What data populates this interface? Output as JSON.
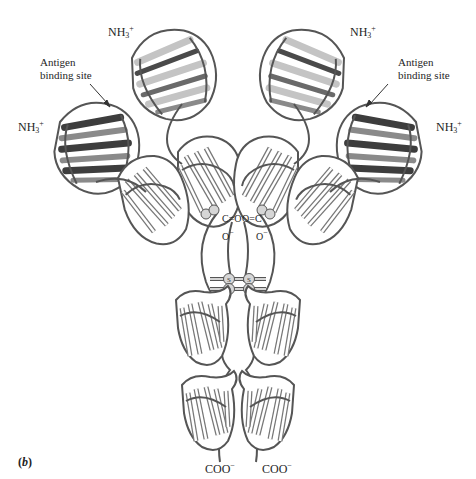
{
  "figure": {
    "panel_label": "b",
    "colors": {
      "heavy_dark": "#4a4a4a",
      "medium_gray": "#8a8a8a",
      "light_gray": "#c4c4c4",
      "outline": "#555555",
      "background": "#ffffff"
    }
  },
  "labels": {
    "nh3_top_left": {
      "base": "NH",
      "sub": "3",
      "sup": "+"
    },
    "nh3_left": {
      "base": "NH",
      "sub": "3",
      "sup": "+"
    },
    "nh3_top_right": {
      "base": "NH",
      "sub": "3",
      "sup": "+"
    },
    "nh3_right": {
      "base": "NH",
      "sub": "3",
      "sup": "+"
    },
    "antigen_left": {
      "line1": "Antigen",
      "line2": "binding site"
    },
    "antigen_right": {
      "line1": "Antigen",
      "line2": "binding site"
    },
    "carboxyl_left": {
      "c": "C",
      "eq": "=O",
      "o": "O",
      "minus": "−"
    },
    "carboxyl_right": {
      "pre": "O=",
      "c": "C",
      "o": "O",
      "minus": "−"
    },
    "disulfide": "S",
    "coo_left": {
      "base": "COO",
      "sup": "−"
    },
    "coo_right": {
      "base": "COO",
      "sup": "−"
    }
  }
}
